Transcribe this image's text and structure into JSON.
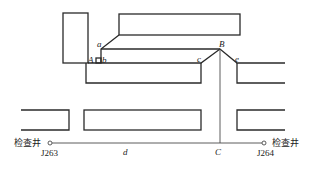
{
  "diagram": {
    "points": {
      "a": "a",
      "A": "A",
      "b": "b",
      "B": "B",
      "c": "c",
      "e": "e",
      "C": "C",
      "d": "d"
    },
    "manholes": [
      {
        "label": "检查井",
        "id": "J263"
      },
      {
        "label": "检查井",
        "id": "J264"
      }
    ],
    "colors": {
      "line": "#2a2a2a",
      "background": "#ffffff"
    }
  }
}
